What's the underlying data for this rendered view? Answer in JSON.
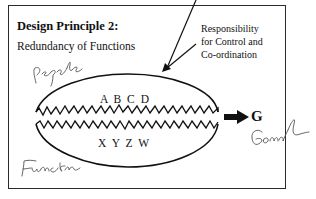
{
  "diagram": {
    "title": "Design Principle 2:",
    "subtitle": "Redundancy of Functions",
    "annotation": {
      "line1": "Responsibility",
      "line2": "for Control and",
      "line3": "Co-ordination"
    },
    "upper_group": "A B C D",
    "lower_group": "X Y Z W",
    "goal_letter": "G",
    "handwritten": {
      "people": "People",
      "goal": "Goal",
      "function": "Function"
    },
    "colors": {
      "ink": "#111111",
      "pencil": "#555555",
      "background": "#ffffff"
    }
  }
}
